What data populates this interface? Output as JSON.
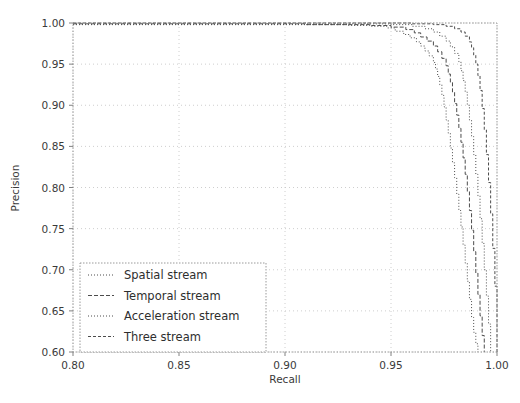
{
  "chart_data": {
    "type": "line",
    "title": "",
    "subtitle": "",
    "xlabel": "Recall",
    "ylabel": "Precision",
    "xlim": [
      0.8,
      1.0
    ],
    "ylim": [
      0.6,
      1.0
    ],
    "xticks": [
      0.8,
      0.85,
      0.9,
      0.95,
      1.0
    ],
    "yticks": [
      0.6,
      0.65,
      0.7,
      0.75,
      0.8,
      0.85,
      0.9,
      0.95,
      1.0
    ],
    "xticklabels": [
      "0.80",
      "0.85",
      "0.90",
      "0.95",
      "1.00"
    ],
    "yticklabels": [
      "0.60",
      "0.65",
      "0.70",
      "0.75",
      "0.80",
      "0.85",
      "0.90",
      "0.95",
      "1.00"
    ],
    "grid": true,
    "grid_style": "dotted",
    "legend_position": "lower left",
    "line_color": "#4c4c4c",
    "grid_color": "#c8c8c8",
    "axis_color": "#808080",
    "series": [
      {
        "name": "Spatial stream",
        "dash": "1,2",
        "x": [
          0.8,
          0.9,
          0.93,
          0.94,
          0.948,
          0.952,
          0.956,
          0.959,
          0.962,
          0.964,
          0.966,
          0.968,
          0.97,
          0.971,
          0.972,
          0.973,
          0.974,
          0.975,
          0.976,
          0.977,
          0.978,
          0.979,
          0.98,
          0.981,
          0.982,
          0.983,
          0.984,
          0.985,
          0.986,
          0.987,
          0.988,
          0.989,
          0.99,
          0.991
        ],
        "y": [
          0.998,
          0.998,
          0.997,
          0.996,
          0.994,
          0.99,
          0.986,
          0.982,
          0.977,
          0.972,
          0.966,
          0.96,
          0.952,
          0.944,
          0.935,
          0.925,
          0.912,
          0.898,
          0.882,
          0.866,
          0.848,
          0.83,
          0.812,
          0.792,
          0.772,
          0.752,
          0.73,
          0.708,
          0.686,
          0.664,
          0.642,
          0.624,
          0.61,
          0.6
        ]
      },
      {
        "name": "Temporal stream",
        "dash": "4,2",
        "x": [
          0.8,
          0.91,
          0.94,
          0.95,
          0.957,
          0.961,
          0.964,
          0.967,
          0.97,
          0.972,
          0.974,
          0.976,
          0.977,
          0.978,
          0.979,
          0.98,
          0.981,
          0.982,
          0.983,
          0.984,
          0.985,
          0.986,
          0.987,
          0.988,
          0.989,
          0.99,
          0.991,
          0.992,
          0.993,
          0.994
        ],
        "y": [
          0.999,
          0.998,
          0.997,
          0.995,
          0.992,
          0.988,
          0.983,
          0.978,
          0.972,
          0.965,
          0.957,
          0.948,
          0.938,
          0.928,
          0.916,
          0.902,
          0.888,
          0.872,
          0.855,
          0.836,
          0.816,
          0.795,
          0.772,
          0.748,
          0.722,
          0.696,
          0.67,
          0.644,
          0.62,
          0.6
        ]
      },
      {
        "name": "Acceleration stream",
        "dash": "1,2",
        "x": [
          0.8,
          0.92,
          0.95,
          0.96,
          0.966,
          0.97,
          0.973,
          0.976,
          0.978,
          0.98,
          0.982,
          0.983,
          0.984,
          0.985,
          0.986,
          0.987,
          0.988,
          0.989,
          0.99,
          0.991,
          0.992,
          0.993,
          0.994,
          0.995,
          0.996,
          0.997
        ],
        "y": [
          0.999,
          0.999,
          0.998,
          0.996,
          0.993,
          0.989,
          0.984,
          0.978,
          0.971,
          0.963,
          0.953,
          0.942,
          0.93,
          0.916,
          0.9,
          0.882,
          0.862,
          0.84,
          0.816,
          0.79,
          0.762,
          0.732,
          0.7,
          0.668,
          0.634,
          0.6
        ]
      },
      {
        "name": "Three stream",
        "dash": "3,2",
        "x": [
          0.8,
          0.93,
          0.96,
          0.97,
          0.976,
          0.98,
          0.983,
          0.985,
          0.987,
          0.988,
          0.989,
          0.99,
          0.991,
          0.992,
          0.993,
          0.994,
          0.995,
          0.996,
          0.997,
          0.998,
          0.999,
          1.0
        ],
        "y": [
          1.0,
          1.0,
          0.999,
          0.998,
          0.996,
          0.993,
          0.989,
          0.984,
          0.977,
          0.97,
          0.961,
          0.95,
          0.936,
          0.918,
          0.896,
          0.87,
          0.84,
          0.806,
          0.768,
          0.726,
          0.68,
          0.6
        ]
      }
    ]
  },
  "legend": {
    "entries": [
      {
        "label": "Spatial stream"
      },
      {
        "label": "Temporal stream"
      },
      {
        "label": "Acceleration stream"
      },
      {
        "label": "Three stream"
      }
    ]
  }
}
